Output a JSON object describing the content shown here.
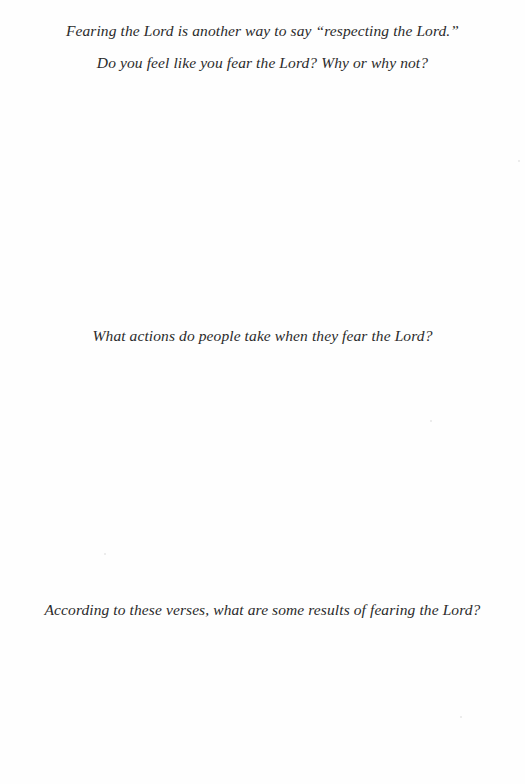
{
  "worksheet": {
    "intro": "Fearing the Lord is another way to say “respecting the Lord.”",
    "questions": [
      {
        "text": "Do you feel like you fear the Lord? Why or why not?"
      },
      {
        "text": "What actions do people take when they fear the Lord?"
      },
      {
        "text": "According to these verses, what are some results of fearing the Lord?"
      }
    ]
  }
}
